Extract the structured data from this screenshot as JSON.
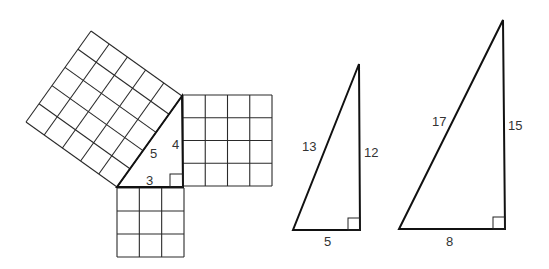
{
  "diagram": {
    "colors": {
      "line": "#111111",
      "grid": "#2a2a2a",
      "label": "#333333",
      "background": "#ffffff"
    },
    "triangle_345": {
      "vertices": {
        "A": [
          117,
          187
        ],
        "B": [
          183,
          187
        ],
        "C": [
          182,
          96
        ]
      },
      "labels": {
        "hyp": {
          "text": "5",
          "pos": [
            150,
            158
          ]
        },
        "vert": {
          "text": "4",
          "pos": [
            172,
            149
          ]
        },
        "base": {
          "text": "3",
          "pos": [
            146,
            185
          ]
        }
      },
      "right_angle": [
        170,
        174,
        13
      ],
      "squares": {
        "hypotenuse": {
          "side_units": 5,
          "corners": [
            [
              117,
              187
            ],
            [
              182,
              96
            ],
            [
              91,
              31
            ],
            [
              26,
              122
            ]
          ]
        },
        "vertical": {
          "side_units": 4,
          "corners": [
            [
              183,
              95
            ],
            [
              272,
              95
            ],
            [
              272,
              186
            ],
            [
              183,
              186
            ]
          ]
        },
        "base": {
          "side_units": 3,
          "corners": [
            [
              117,
              188
            ],
            [
              184,
              188
            ],
            [
              184,
              257
            ],
            [
              117,
              257
            ]
          ]
        }
      }
    },
    "triangle_51213": {
      "vertices": {
        "A": [
          293,
          230
        ],
        "B": [
          360,
          230
        ],
        "C": [
          359,
          64
        ]
      },
      "labels": {
        "hyp": {
          "text": "13",
          "pos": [
            302,
            151
          ]
        },
        "vert": {
          "text": "12",
          "pos": [
            364,
            157
          ]
        },
        "base": {
          "text": "5",
          "pos": [
            324,
            246
          ]
        }
      },
      "right_angle": [
        348,
        218,
        12
      ]
    },
    "triangle_81517": {
      "vertices": {
        "A": [
          399,
          229
        ],
        "B": [
          505,
          229
        ],
        "C": [
          503,
          20
        ]
      },
      "labels": {
        "hyp": {
          "text": "17",
          "pos": [
            432,
            126
          ]
        },
        "vert": {
          "text": "15",
          "pos": [
            508,
            130
          ]
        },
        "base": {
          "text": "8",
          "pos": [
            446,
            246
          ]
        }
      },
      "right_angle": [
        493,
        217,
        12
      ]
    }
  }
}
